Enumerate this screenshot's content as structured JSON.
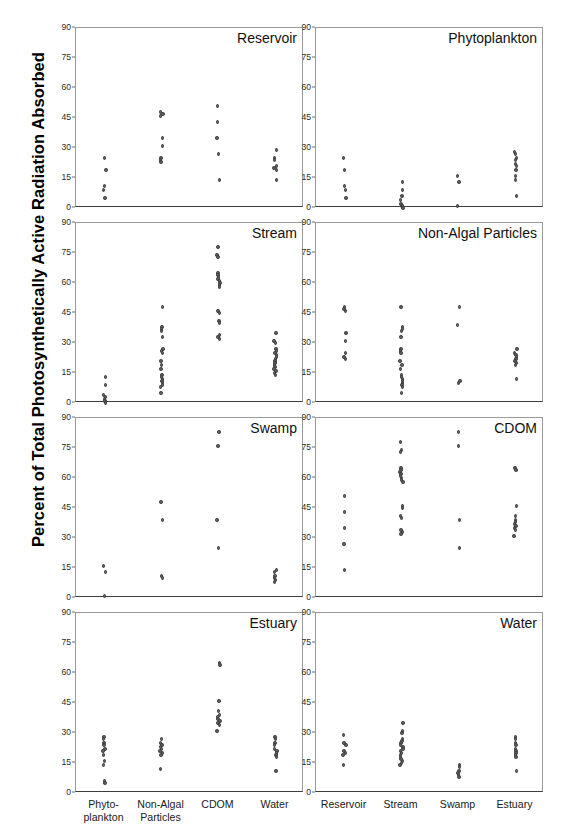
{
  "chart_data": {
    "type": "scatter",
    "title": "",
    "ylabel": "Percent of Total Photosynthetically Active Radiation Absorbed",
    "xlabel": "",
    "ylim": [
      0,
      90
    ],
    "yticks": [
      0,
      15,
      30,
      45,
      60,
      75,
      90
    ],
    "grid": false,
    "legend": null,
    "layout": {
      "rows": 4,
      "cols": 2
    },
    "left_column_categories": [
      "Phyto-\nplankton",
      "Non-Algal\nParticles",
      "CDOM",
      "Water"
    ],
    "right_column_categories": [
      "Reservoir",
      "Stream",
      "Swamp",
      "Estuary"
    ],
    "panels": [
      {
        "title": "Reservoir",
        "column": "left",
        "row": 0,
        "categories": [
          "Phytoplankton",
          "Non-Algal Particles",
          "CDOM",
          "Water"
        ],
        "values": [
          [
            25,
            19,
            11,
            9,
            5
          ],
          [
            48,
            47,
            46,
            35,
            31,
            25,
            24,
            23
          ],
          [
            51,
            43,
            35,
            27,
            14
          ],
          [
            29,
            25,
            24,
            21,
            20,
            19,
            14
          ]
        ]
      },
      {
        "title": "Phytoplankton",
        "column": "right",
        "row": 0,
        "categories": [
          "Reservoir",
          "Stream",
          "Swamp",
          "Estuary"
        ],
        "values": [
          [
            25,
            19,
            11,
            9,
            5
          ],
          [
            13,
            9,
            6,
            4,
            2,
            1,
            1,
            0
          ],
          [
            16,
            13,
            1
          ],
          [
            28,
            27,
            25,
            24,
            22,
            21,
            19,
            16,
            14,
            6
          ]
        ]
      },
      {
        "title": "Stream",
        "column": "left",
        "row": 1,
        "categories": [
          "Phytoplankton",
          "Non-Algal Particles",
          "CDOM",
          "Water"
        ],
        "values": [
          [
            13,
            9,
            4,
            3,
            2,
            1,
            1,
            0
          ],
          [
            48,
            38,
            37,
            36,
            33,
            27,
            26,
            25,
            21,
            19,
            17,
            14,
            13,
            12,
            11,
            10,
            9,
            8,
            5
          ],
          [
            78,
            74,
            73,
            65,
            64,
            63,
            62,
            61,
            60,
            59,
            58,
            46,
            45,
            41,
            40,
            34,
            33,
            32
          ],
          [
            35,
            31,
            30,
            27,
            26,
            25,
            24,
            23,
            22,
            21,
            20,
            19,
            18,
            17,
            16,
            15,
            14
          ]
        ]
      },
      {
        "title": "Non-Algal Particles",
        "column": "right",
        "row": 1,
        "categories": [
          "Reservoir",
          "Stream",
          "Swamp",
          "Estuary"
        ],
        "values": [
          [
            48,
            47,
            46,
            35,
            31,
            25,
            23,
            22
          ],
          [
            48,
            38,
            37,
            36,
            33,
            27,
            26,
            25,
            21,
            19,
            17,
            14,
            13,
            12,
            11,
            10,
            9,
            8,
            5
          ],
          [
            48,
            39,
            11,
            10
          ],
          [
            27,
            25,
            24,
            23,
            22,
            21,
            20,
            19,
            12
          ]
        ]
      },
      {
        "title": "Swamp",
        "column": "left",
        "row": 2,
        "categories": [
          "Phytoplankton",
          "Non-Algal Particles",
          "CDOM",
          "Water"
        ],
        "values": [
          [
            16,
            13,
            1
          ],
          [
            48,
            39,
            11,
            10
          ],
          [
            83,
            76,
            39,
            25
          ],
          [
            14,
            13,
            11,
            10,
            9,
            8
          ]
        ]
      },
      {
        "title": "CDOM",
        "column": "right",
        "row": 2,
        "categories": [
          "Reservoir",
          "Stream",
          "Swamp",
          "Estuary"
        ],
        "values": [
          [
            51,
            43,
            35,
            27,
            14
          ],
          [
            78,
            74,
            73,
            65,
            64,
            63,
            62,
            61,
            60,
            59,
            58,
            46,
            45,
            41,
            40,
            34,
            33,
            32
          ],
          [
            83,
            76,
            39,
            25
          ],
          [
            65,
            64,
            46,
            41,
            39,
            38,
            37,
            36,
            35,
            34,
            31
          ]
        ]
      },
      {
        "title": "Estuary",
        "column": "left",
        "row": 3,
        "categories": [
          "Phytoplankton",
          "Non-Algal Particles",
          "CDOM",
          "Water"
        ],
        "values": [
          [
            28,
            27,
            25,
            24,
            22,
            21,
            19,
            16,
            14,
            6,
            5
          ],
          [
            27,
            25,
            24,
            23,
            22,
            21,
            20,
            19,
            12
          ],
          [
            65,
            64,
            46,
            41,
            39,
            38,
            37,
            36,
            35,
            34,
            31
          ],
          [
            28,
            27,
            25,
            24,
            22,
            21,
            20,
            19,
            18,
            11
          ]
        ]
      },
      {
        "title": "Water",
        "column": "right",
        "row": 3,
        "categories": [
          "Reservoir",
          "Stream",
          "Swamp",
          "Estuary"
        ],
        "values": [
          [
            29,
            25,
            24,
            21,
            20,
            19,
            14
          ],
          [
            35,
            31,
            30,
            27,
            26,
            25,
            24,
            23,
            22,
            21,
            20,
            19,
            18,
            17,
            16,
            15,
            14
          ],
          [
            14,
            13,
            11,
            10,
            9,
            8
          ],
          [
            28,
            27,
            25,
            24,
            22,
            21,
            20,
            19,
            18,
            11
          ]
        ]
      }
    ]
  },
  "colors": {
    "marker": "#5d5d5d",
    "marker_edge": "#3a3a3a",
    "axis": "#3d3d3d",
    "frame": "#9a9a9a",
    "text": "#000000",
    "background": "#ffffff"
  }
}
